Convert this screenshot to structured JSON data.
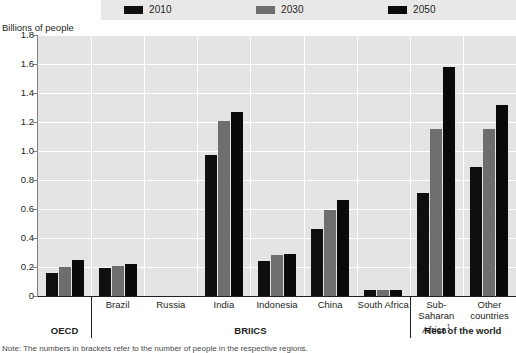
{
  "axis_title": "Billions of people",
  "legend": {
    "items": [
      {
        "label": "2010",
        "color": "#0f0f0f"
      },
      {
        "label": "2030",
        "color": "#6e6e6e"
      },
      {
        "label": "2050",
        "color": "#0a0a0a"
      }
    ]
  },
  "groups": [
    {
      "label": "OECD",
      "bold": true
    },
    {
      "label": "BRIICS",
      "bold": true
    },
    {
      "label": "Rest of the world",
      "bold": true
    }
  ],
  "footnote": "Note: The numbers in brackets refer to the number of people in the respective regions.",
  "chart_data": {
    "type": "bar",
    "title": "",
    "xlabel": "",
    "ylabel": "Billions of people",
    "ylim": [
      0,
      1.8
    ],
    "yticks": [
      "0",
      "0.2",
      "0.4",
      "0.6",
      "0.8",
      "1.0",
      "1.2",
      "1.4",
      "1.6",
      "1.8"
    ],
    "grid": true,
    "legend_position": "top",
    "categories": [
      "OECD",
      "Brazil",
      "Russia",
      "India",
      "Indonesia",
      "China",
      "South Africa",
      "Sub-Saharan Africa¹",
      "Other countries"
    ],
    "series": [
      {
        "name": "2010",
        "color": "#0f0f0f",
        "values": [
          0.16,
          0.19,
          0.0,
          0.97,
          0.24,
          0.46,
          0.04,
          0.71,
          0.89
        ]
      },
      {
        "name": "2030",
        "color": "#6e6e6e",
        "values": [
          0.2,
          0.21,
          0.0,
          1.21,
          0.28,
          0.59,
          0.04,
          1.15,
          1.15
        ]
      },
      {
        "name": "2050",
        "color": "#0a0a0a",
        "values": [
          0.25,
          0.22,
          0.0,
          1.27,
          0.29,
          0.66,
          0.04,
          1.58,
          1.32
        ]
      }
    ],
    "group_spans": [
      {
        "label": "OECD",
        "from": 0,
        "to": 0
      },
      {
        "label": "BRIICS",
        "from": 1,
        "to": 6
      },
      {
        "label": "Rest of the world",
        "from": 7,
        "to": 8
      }
    ]
  }
}
